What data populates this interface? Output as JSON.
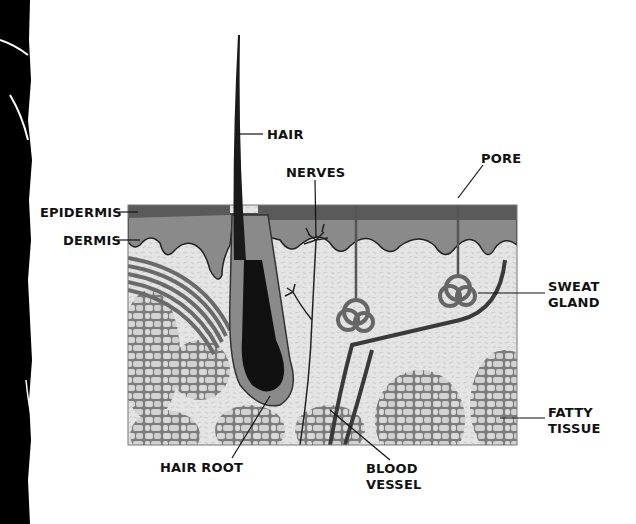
{
  "diagram": {
    "type": "anatomical-cross-section",
    "colors": {
      "epidermis_outer": "#5a5a5a",
      "epidermis_inner": "#8a8a8a",
      "dermis": "#e2e2e2",
      "fatty_tissue_cells": "#d4d4d4",
      "cell_walls": "#7a7a7a",
      "hair": "#1a1a1a",
      "vessel": "#3a3a3a",
      "label_text": "#111111",
      "background": "#ffffff",
      "torn_edge": "#000000"
    },
    "labels": {
      "hair": "HAIR",
      "nerves": "NERVES",
      "pore": "PORE",
      "epidermis": "EPIDERMIS",
      "dermis": "DERMIS",
      "sweat_gland_line1": "SWEAT",
      "sweat_gland_line2": "GLAND",
      "fatty_tissue_line1": "FATTY",
      "fatty_tissue_line2": "TISSUE",
      "hair_root": "HAIR ROOT",
      "blood_vessel_line1": "BLOOD",
      "blood_vessel_line2": "VESSEL"
    }
  }
}
